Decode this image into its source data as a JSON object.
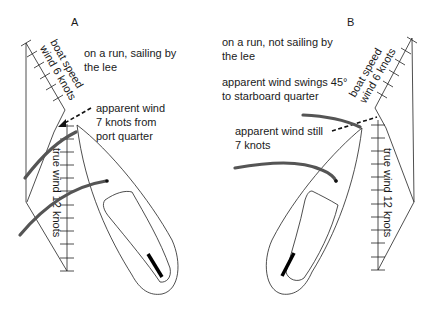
{
  "panels": [
    {
      "id": "A",
      "label": "A",
      "heading": [
        "on a run, sailing by",
        "the lee"
      ],
      "apparent_wind_note": [
        "apparent wind",
        "7 knots from",
        "port quarter"
      ],
      "boat_speed_label": [
        "boat speed",
        "wind 6 knots"
      ],
      "true_wind_label": "true wind 12 knots"
    },
    {
      "id": "B",
      "label": "B",
      "heading": [
        "on a run, not sailing by",
        "the lee"
      ],
      "swing_note": [
        "apparent wind swings 45°",
        "to starboard quarter"
      ],
      "apparent_wind_note": [
        "apparent wind still",
        "7 knots"
      ],
      "boat_speed_label": [
        "boat speed",
        "wind 6 knots"
      ],
      "true_wind_label": "true wind 12 knots"
    }
  ],
  "colors": {
    "line": "#222222",
    "sail": "#555555",
    "background": "#ffffff"
  }
}
